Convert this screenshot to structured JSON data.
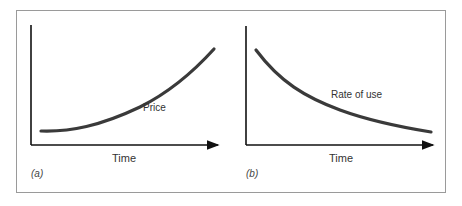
{
  "figure": {
    "panels": [
      {
        "id": "a",
        "panel_label": "(a)",
        "curve_label": "Price",
        "xlabel": "Time",
        "trend": "increasing"
      },
      {
        "id": "b",
        "panel_label": "(b)",
        "curve_label": "Rate of use",
        "xlabel": "Time",
        "trend": "decreasing"
      }
    ]
  },
  "colors": {
    "axis": "#111111",
    "curve": "#3a3a3a",
    "frame": "#9a9a9a"
  }
}
